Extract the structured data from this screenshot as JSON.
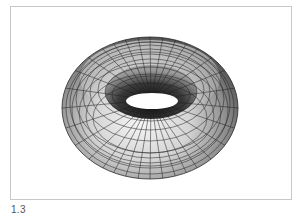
{
  "figure": {
    "caption": "1.3"
  }
}
